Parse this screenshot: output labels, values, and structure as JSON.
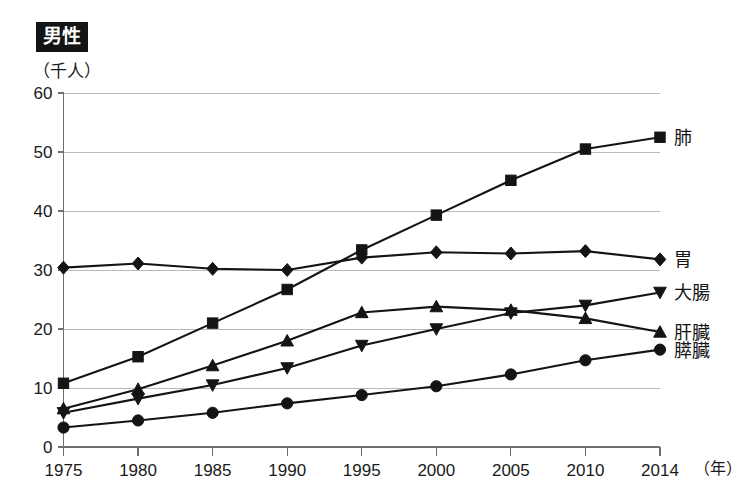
{
  "chart_data": {
    "type": "line",
    "title": "男性",
    "ylabel": "（千人）",
    "xlabel": "（年）",
    "x": [
      1975,
      1980,
      1985,
      1990,
      1995,
      2000,
      2005,
      2010,
      2014
    ],
    "categories": [
      "1975",
      "1980",
      "1985",
      "1990",
      "1995",
      "2000",
      "2005",
      "2010",
      "2014"
    ],
    "ylim": [
      0,
      60
    ],
    "yticks": [
      0,
      10,
      20,
      30,
      40,
      50,
      60
    ],
    "ytick_labels": [
      "0",
      "10",
      "20",
      "30",
      "40",
      "50",
      "60"
    ],
    "grid": true,
    "legend_position": "right-of-line-end",
    "series": [
      {
        "name": "肺",
        "marker": "square",
        "values": [
          10.8,
          15.3,
          21.0,
          26.7,
          33.4,
          39.3,
          45.2,
          50.5,
          52.5
        ]
      },
      {
        "name": "胃",
        "marker": "diamond",
        "values": [
          30.4,
          31.1,
          30.2,
          30.0,
          32.1,
          33.0,
          32.8,
          33.2,
          31.8
        ]
      },
      {
        "name": "大腸",
        "marker": "triangle-down",
        "values": [
          5.8,
          8.2,
          10.5,
          13.4,
          17.2,
          20.0,
          22.7,
          24.0,
          26.2
        ]
      },
      {
        "name": "肝臓",
        "marker": "triangle-up",
        "values": [
          6.5,
          9.8,
          13.8,
          18.0,
          22.8,
          23.8,
          23.2,
          21.8,
          19.5
        ]
      },
      {
        "name": "膵臓",
        "marker": "circle",
        "values": [
          3.3,
          4.5,
          5.8,
          7.4,
          8.8,
          10.3,
          12.3,
          14.7,
          16.5
        ]
      }
    ]
  }
}
